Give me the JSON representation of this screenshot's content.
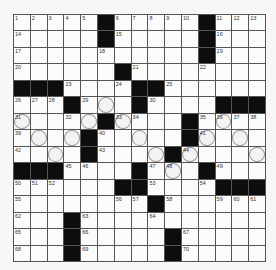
{
  "puzzle": {
    "type": "crossword",
    "rows": 15,
    "cols": 15,
    "legend": {
      "black": "#",
      "empty": 0,
      "numbered": "integer clue number"
    },
    "grid": [
      [
        1,
        2,
        3,
        4,
        5,
        "#",
        6,
        7,
        8,
        9,
        10,
        "#",
        11,
        12,
        13
      ],
      [
        14,
        0,
        0,
        0,
        0,
        "#",
        15,
        0,
        0,
        0,
        0,
        "#",
        16,
        0,
        0
      ],
      [
        17,
        0,
        0,
        0,
        0,
        18,
        0,
        0,
        0,
        0,
        0,
        "#",
        19,
        0,
        0
      ],
      [
        20,
        0,
        0,
        0,
        0,
        0,
        "#",
        21,
        0,
        0,
        0,
        22,
        0,
        0,
        0
      ],
      [
        "#",
        "#",
        "#",
        23,
        0,
        0,
        24,
        "#",
        "#",
        25,
        0,
        0,
        0,
        0,
        0
      ],
      [
        26,
        27,
        28,
        "#",
        29,
        0,
        0,
        "#",
        30,
        0,
        0,
        0,
        "#",
        "#",
        "#"
      ],
      [
        31,
        0,
        0,
        32,
        0,
        "#",
        33,
        34,
        0,
        0,
        "#",
        35,
        36,
        37,
        38
      ],
      [
        39,
        0,
        0,
        0,
        "#",
        40,
        0,
        0,
        0,
        0,
        "#",
        41,
        0,
        0,
        0
      ],
      [
        42,
        0,
        0,
        0,
        "#",
        43,
        0,
        0,
        0,
        "#",
        44,
        0,
        0,
        0,
        0
      ],
      [
        "#",
        "#",
        "#",
        45,
        46,
        0,
        0,
        "#",
        47,
        48,
        0,
        "#",
        49,
        0,
        0
      ],
      [
        50,
        51,
        52,
        0,
        0,
        0,
        "#",
        "#",
        53,
        0,
        0,
        54,
        "#",
        "#",
        "#"
      ],
      [
        55,
        0,
        0,
        0,
        0,
        0,
        56,
        57,
        "#",
        58,
        0,
        0,
        59,
        60,
        61
      ],
      [
        62,
        0,
        0,
        "#",
        63,
        0,
        0,
        0,
        64,
        0,
        0,
        0,
        0,
        0,
        0
      ],
      [
        65,
        0,
        0,
        "#",
        66,
        0,
        0,
        0,
        0,
        "#",
        67,
        0,
        0,
        0,
        0
      ],
      [
        68,
        0,
        0,
        "#",
        69,
        0,
        0,
        0,
        0,
        "#",
        70,
        0,
        0,
        0,
        0
      ]
    ],
    "circled_cells": [
      [
        6,
        6
      ],
      [
        7,
        1
      ],
      [
        7,
        5
      ],
      [
        7,
        7
      ],
      [
        7,
        13
      ],
      [
        8,
        2
      ],
      [
        8,
        4
      ],
      [
        8,
        8
      ],
      [
        8,
        12
      ],
      [
        8,
        14
      ],
      [
        9,
        3
      ],
      [
        9,
        9
      ],
      [
        9,
        11
      ],
      [
        9,
        15
      ],
      [
        10,
        10
      ]
    ],
    "colors": {
      "black_square": "#0d0d0d",
      "white_square": "#fbfbfb",
      "grid_line": "#555555",
      "circle": "#999999"
    }
  }
}
